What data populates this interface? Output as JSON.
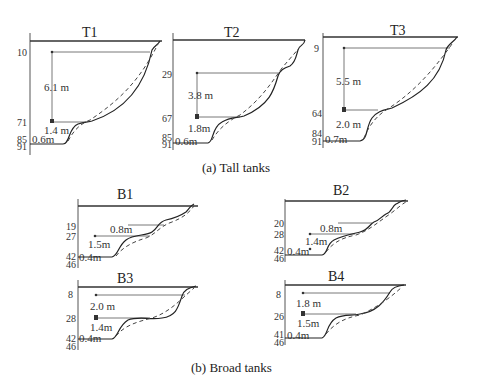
{
  "figure": {
    "tall_caption": "(a) Tall tanks",
    "broad_caption": "(b) Broad tanks"
  },
  "tanks": {
    "T1": {
      "title": "T1",
      "ticks": [
        "10",
        "71",
        "85",
        "91"
      ],
      "dims": [
        "6.1 m",
        "1.4 m",
        "0.6m"
      ]
    },
    "T2": {
      "title": "T2",
      "ticks": [
        "29",
        "67",
        "85",
        "91"
      ],
      "dims": [
        "3.8 m",
        "1.8m",
        "0.6m"
      ]
    },
    "T3": {
      "title": "T3",
      "ticks": [
        "9",
        "64",
        "84",
        "91"
      ],
      "dims": [
        "5.5 m",
        "2.0 m",
        "0.7m"
      ]
    },
    "B1": {
      "title": "B1",
      "ticks": [
        "19",
        "27",
        "42",
        "46"
      ],
      "dims": [
        "0.8m",
        "1.5m",
        "0.4m"
      ]
    },
    "B2": {
      "title": "B2",
      "ticks": [
        "20",
        "28",
        "42",
        "46"
      ],
      "dims": [
        "0.8m",
        "1.4m",
        "0.4m"
      ]
    },
    "B3": {
      "title": "B3",
      "ticks": [
        "8",
        "28",
        "42",
        "46"
      ],
      "dims": [
        "2.0 m",
        "1.4m",
        "0.4m"
      ]
    },
    "B4": {
      "title": "B4",
      "ticks": [
        "8",
        "26",
        "41",
        "46"
      ],
      "dims": [
        "1.8 m",
        "1.5m",
        "0.4m"
      ]
    }
  }
}
